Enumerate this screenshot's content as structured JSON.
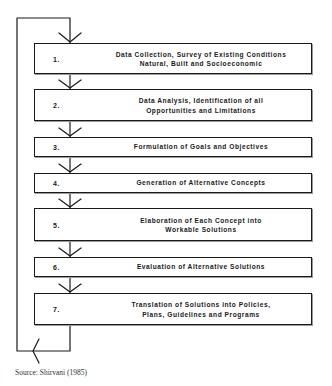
{
  "diagram": {
    "type": "flowchart-with-feedback-loop",
    "colors": {
      "line": "#1a1a1a",
      "background": "#ffffff",
      "source_text": "#333333"
    },
    "steps": [
      {
        "number": "1.",
        "lines": [
          "Data Collection, Survey of Existing Conditions",
          "Natural, Built and Socioeconomic"
        ]
      },
      {
        "number": "2.",
        "lines": [
          "Data Analysis, Identification of all",
          "Opportunities and Limitations"
        ]
      },
      {
        "number": "3.",
        "lines": [
          "Formulation of Goals and Objectives"
        ]
      },
      {
        "number": "4.",
        "lines": [
          "Generation of Alternative Concepts"
        ]
      },
      {
        "number": "5.",
        "lines": [
          "Elaboration of Each Concept into",
          "Workable Solutions"
        ]
      },
      {
        "number": "6.",
        "lines": [
          "Evaluation of Alternative Solutions"
        ]
      },
      {
        "number": "7.",
        "lines": [
          "Translation of Solutions into Policies,",
          "Plans, Guidelines and Programs"
        ]
      }
    ],
    "feedback_loop": "Output of step 7 loops back to step 1",
    "source": "Source: Shirvani (1985)"
  }
}
